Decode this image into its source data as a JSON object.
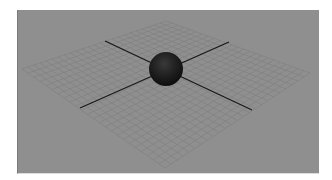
{
  "viewport": {
    "label": "3D perspective viewport",
    "background_color": "#8f8f8f",
    "grid": {
      "divisions": 24,
      "line_color": "#7d7d7d",
      "corners": {
        "top": [
          166,
          21
        ],
        "right": [
          310,
          73
        ],
        "bottom": [
          165,
          168
        ],
        "left": [
          22,
          69
        ]
      }
    },
    "axes": {
      "color": "#1a1a1a",
      "axis_a": {
        "from": [
          105,
          41
        ],
        "to": [
          252,
          110
        ]
      },
      "axis_b": {
        "from": [
          80,
          108
        ],
        "to": [
          229,
          42
        ]
      }
    },
    "object": {
      "type": "sphere",
      "center": [
        166,
        69
      ],
      "radius": 17,
      "color": "#1c1c1c"
    }
  }
}
